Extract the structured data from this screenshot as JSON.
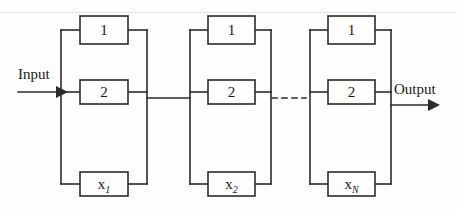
{
  "figure": {
    "type": "block-diagram",
    "background_color": "#fdfdfb",
    "line_color": "#2b2b2b"
  },
  "io": {
    "input_label": "Input",
    "output_label": "Output"
  },
  "ellipsis": {
    "style": "dashed",
    "label": "- - - -"
  },
  "stages": [
    {
      "id": "stage-1",
      "blocks": [
        {
          "id": "stage-1-block-1",
          "label": "1",
          "italic": false
        },
        {
          "id": "stage-1-block-2",
          "label": "2",
          "italic": false
        },
        {
          "id": "stage-1-block-x",
          "label": "x",
          "subscript": "1",
          "italic": true
        }
      ]
    },
    {
      "id": "stage-2",
      "blocks": [
        {
          "id": "stage-2-block-1",
          "label": "1",
          "italic": false
        },
        {
          "id": "stage-2-block-2",
          "label": "2",
          "italic": false
        },
        {
          "id": "stage-2-block-x",
          "label": "x",
          "subscript": "2",
          "italic": true
        }
      ]
    },
    {
      "id": "stage-n",
      "blocks": [
        {
          "id": "stage-n-block-1",
          "label": "1",
          "italic": false
        },
        {
          "id": "stage-n-block-2",
          "label": "2",
          "italic": false
        },
        {
          "id": "stage-n-block-x",
          "label": "x",
          "subscript": "N",
          "italic": true
        }
      ]
    }
  ]
}
